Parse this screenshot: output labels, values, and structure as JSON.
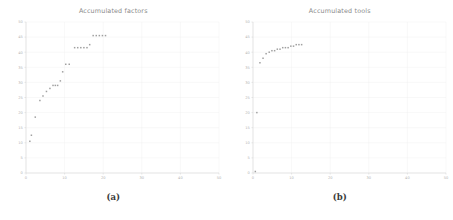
{
  "figure": {
    "panels": [
      {
        "caption": "(a)",
        "title": "Accumulated factors",
        "chart_data": {
          "type": "scatter",
          "title": "Accumulated factors",
          "xlabel": "",
          "ylabel": "",
          "xlim": [
            0,
            50
          ],
          "ylim": [
            0,
            50
          ],
          "xticks": [
            0,
            10,
            20,
            30,
            40,
            50
          ],
          "yticks": [
            0,
            5,
            10,
            15,
            20,
            25,
            30,
            35,
            40,
            45,
            50
          ],
          "xtick_labels": [
            "0",
            "10",
            "20",
            "30",
            "40",
            "50"
          ],
          "ytick_labels": [
            "0",
            "5",
            "10",
            "15",
            "20",
            "25",
            "30",
            "35",
            "40",
            "45",
            "50"
          ],
          "grid": true,
          "legend": "none",
          "marker_color": "#a0a0a0",
          "series": [
            {
              "name": "Accumulated factors",
              "x": [
                1,
                1.4,
                2.4,
                3.6,
                4.4,
                5.3,
                6.2,
                7.0,
                7.6,
                8.2,
                8.9,
                9.5,
                10.3,
                11.2,
                12.6,
                13.4,
                14.2,
                15.0,
                15.8,
                16.5,
                17.4,
                18.2,
                19.0,
                19.8,
                20.6
              ],
              "y": [
                10.5,
                12.5,
                18.5,
                24.0,
                25.5,
                27.0,
                28.0,
                29.0,
                29.0,
                29.0,
                30.5,
                33.5,
                36.0,
                36.0,
                41.5,
                41.5,
                41.5,
                41.5,
                41.5,
                42.5,
                45.5,
                45.5,
                45.5,
                45.5,
                45.5
              ]
            }
          ]
        }
      },
      {
        "caption": "(b)",
        "title": "Accumulated tools",
        "chart_data": {
          "type": "scatter",
          "title": "Accumulated tools",
          "xlabel": "",
          "ylabel": "",
          "xlim": [
            0,
            50
          ],
          "ylim": [
            0,
            50
          ],
          "xticks": [
            0,
            10,
            20,
            30,
            40,
            50
          ],
          "yticks": [
            0,
            5,
            10,
            15,
            20,
            25,
            30,
            35,
            40,
            45,
            50
          ],
          "xtick_labels": [
            "0",
            "10",
            "20",
            "30",
            "40",
            "50"
          ],
          "ytick_labels": [
            "0",
            "5",
            "10",
            "15",
            "20",
            "25",
            "30",
            "35",
            "40",
            "45",
            "50"
          ],
          "grid": true,
          "legend": "none",
          "marker_color": "#a0a0a0",
          "series": [
            {
              "name": "Accumulated tools",
              "x": [
                0.6,
                1.0,
                1.8,
                2.6,
                3.4,
                4.2,
                4.9,
                5.6,
                6.3,
                7.0,
                7.7,
                8.4,
                9.1,
                9.8,
                10.5,
                11.2,
                11.9,
                12.6
              ],
              "y": [
                0.5,
                20.0,
                36.5,
                38.0,
                39.5,
                40.0,
                40.5,
                40.5,
                41.0,
                41.0,
                41.5,
                41.5,
                41.5,
                42.0,
                42.0,
                42.5,
                42.5,
                42.5
              ]
            }
          ]
        }
      }
    ]
  }
}
